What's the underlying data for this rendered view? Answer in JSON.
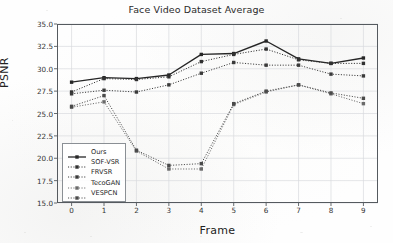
{
  "chart_data": {
    "type": "line",
    "title": "Face Video Dataset Average",
    "xlabel": "Frame",
    "ylabel": "PSNR",
    "x": [
      0,
      1,
      2,
      3,
      4,
      5,
      6,
      7,
      8,
      9
    ],
    "xlim": [
      -0.45,
      9.45
    ],
    "ylim": [
      15.0,
      35.0
    ],
    "xticks": [
      "0",
      "1",
      "2",
      "3",
      "4",
      "5",
      "6",
      "7",
      "8",
      "9"
    ],
    "yticks": [
      "15.0",
      "17.5",
      "20.0",
      "22.5",
      "25.0",
      "27.5",
      "30.0",
      "32.5",
      "35.0"
    ],
    "ytick_values": [
      15.0,
      17.5,
      20.0,
      22.5,
      25.0,
      27.5,
      30.0,
      32.5,
      35.0
    ],
    "grid": true,
    "legend_position": "lower left",
    "series": [
      {
        "name": "Ours",
        "style": "solid",
        "marker": "square",
        "color": "#262626",
        "values": [
          28.5,
          29.0,
          28.9,
          29.3,
          31.6,
          31.7,
          33.1,
          31.1,
          30.6,
          31.2
        ]
      },
      {
        "name": "SOF-VSR",
        "style": "dotted",
        "marker": "square",
        "color": "#303030",
        "values": [
          27.4,
          28.9,
          28.8,
          29.1,
          30.8,
          31.6,
          32.2,
          31.0,
          30.6,
          30.6
        ]
      },
      {
        "name": "FRVSR",
        "style": "dotted",
        "marker": "square",
        "color": "#3a3a3a",
        "values": [
          27.2,
          27.6,
          27.4,
          28.2,
          29.5,
          30.7,
          30.4,
          30.4,
          29.4,
          29.2
        ]
      },
      {
        "name": "TecoGAN",
        "style": "dotted",
        "marker": "square",
        "color": "#6a6a6a",
        "values": [
          25.7,
          26.3,
          20.8,
          18.8,
          18.8,
          26.0,
          27.4,
          28.2,
          27.2,
          26.1
        ]
      },
      {
        "name": "VESPCN",
        "style": "dotted",
        "marker": "square",
        "color": "#4a4a4a",
        "values": [
          25.8,
          27.0,
          20.9,
          19.2,
          19.4,
          26.1,
          27.5,
          28.2,
          27.3,
          26.7
        ]
      }
    ]
  }
}
